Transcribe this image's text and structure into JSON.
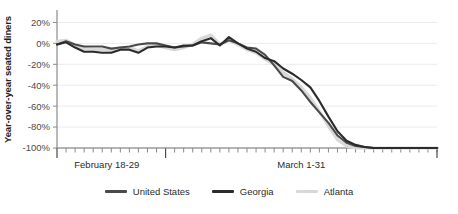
{
  "chart_data": {
    "type": "line",
    "title": "",
    "xlabel": "",
    "ylabel": "Year-over-year seated diners",
    "ylim": [
      -100,
      30
    ],
    "yticks": [
      20,
      0,
      -20,
      -40,
      -60,
      -80,
      -100
    ],
    "ytick_labels": [
      "20%",
      "0%",
      "-20%",
      "-40%",
      "-60%",
      "-80%",
      "-100%"
    ],
    "grid": true,
    "legend_position": "bottom",
    "x_band_labels": [
      "February 18-29",
      "March 1-31"
    ],
    "x": [
      "Feb 18",
      "Feb 19",
      "Feb 20",
      "Feb 21",
      "Feb 22",
      "Feb 23",
      "Feb 24",
      "Feb 25",
      "Feb 26",
      "Feb 27",
      "Feb 28",
      "Feb 29",
      "Mar 1",
      "Mar 2",
      "Mar 3",
      "Mar 4",
      "Mar 5",
      "Mar 6",
      "Mar 7",
      "Mar 8",
      "Mar 9",
      "Mar 10",
      "Mar 11",
      "Mar 12",
      "Mar 13",
      "Mar 14",
      "Mar 15",
      "Mar 16",
      "Mar 17",
      "Mar 18",
      "Mar 19",
      "Mar 20",
      "Mar 21",
      "Mar 22",
      "Mar 23",
      "Mar 24",
      "Mar 25",
      "Mar 26",
      "Mar 27",
      "Mar 28",
      "Mar 29",
      "Mar 30",
      "Mar 31"
    ],
    "series": [
      {
        "name": "United States",
        "color": "#4a4a4a",
        "values": [
          -1,
          2,
          -1,
          -3,
          -3,
          -3,
          -5,
          -4,
          -3,
          -1,
          0,
          0,
          -2,
          -4,
          -3,
          -2,
          1,
          0,
          -1,
          3,
          0,
          -4,
          -5,
          -11,
          -21,
          -32,
          -36,
          -45,
          -56,
          -66,
          -76,
          -88,
          -95,
          -98,
          -99,
          -100,
          -100,
          -100,
          -100,
          -100,
          -100,
          -100,
          -100
        ]
      },
      {
        "name": "Georgia",
        "color": "#2b2b2b",
        "values": [
          -1,
          1,
          -4,
          -8,
          -8,
          -9,
          -9,
          -6,
          -6,
          -9,
          -4,
          -3,
          -3,
          -4,
          -2,
          -2,
          2,
          5,
          -2,
          6,
          0,
          -5,
          -8,
          -14,
          -17,
          -24,
          -29,
          -35,
          -42,
          -55,
          -70,
          -84,
          -93,
          -97,
          -99,
          -100,
          -100,
          -100,
          -100,
          -100,
          -100,
          -100,
          -100
        ]
      },
      {
        "name": "Atlanta",
        "color": "#d8d8d8",
        "values": [
          2,
          3,
          -2,
          -5,
          -6,
          -6,
          -7,
          -4,
          -4,
          -7,
          -3,
          -2,
          -4,
          -6,
          -4,
          -1,
          5,
          8,
          -1,
          3,
          -1,
          -6,
          -9,
          -15,
          -20,
          -28,
          -34,
          -42,
          -52,
          -65,
          -79,
          -92,
          -98,
          -100,
          -100,
          -100,
          -100,
          -100,
          -100,
          -100,
          -100,
          -100,
          -100
        ]
      }
    ]
  },
  "legend": {
    "items": [
      {
        "label": "United States",
        "color": "#4a4a4a"
      },
      {
        "label": "Georgia",
        "color": "#2b2b2b"
      },
      {
        "label": "Atlanta",
        "color": "#d8d8d8"
      }
    ]
  },
  "axes": {
    "y_title": "Year-over-year seated diners"
  }
}
